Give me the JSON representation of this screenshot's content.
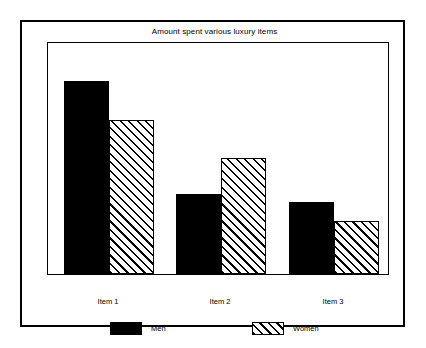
{
  "chart_data": {
    "type": "bar",
    "title": "Amount spent various luxury items",
    "xlabel": "",
    "ylabel": "",
    "categories": [
      "Item 1",
      "Item 2",
      "Item 3"
    ],
    "series": [
      {
        "name": "Men",
        "values": [
          193,
          80,
          72
        ],
        "fill": "solid-black",
        "color": "#000000"
      },
      {
        "name": "Women",
        "values": [
          154,
          116,
          53
        ],
        "fill": "diagonal-hatch",
        "color": "#000000"
      }
    ],
    "ylim": [
      0,
      233
    ],
    "grid": false,
    "legend_position": "bottom",
    "axis_ticks_visible": false
  },
  "legend": {
    "entries": [
      {
        "label": "Men",
        "swatch": "solid-black-swatch"
      },
      {
        "label": "Women",
        "swatch": "hatched-swatch"
      }
    ]
  },
  "colors": {
    "frame": "#000000",
    "background": "#ffffff",
    "men_fill": "#000000",
    "women_fill": "#ffffff",
    "hatch_stroke": "#000000"
  }
}
